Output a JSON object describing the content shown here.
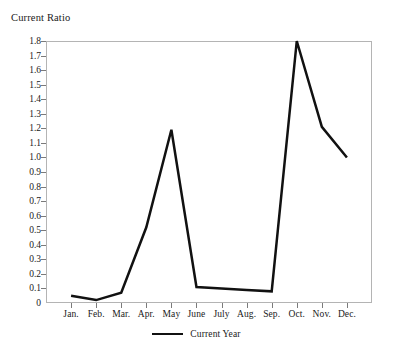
{
  "chart_data": {
    "type": "line",
    "title": "",
    "ylabel": "Current Ratio",
    "xlabel": "",
    "categories": [
      "Jan.",
      "Feb.",
      "Mar.",
      "Apr.",
      "May",
      "June",
      "July",
      "Aug.",
      "Sep.",
      "Oct.",
      "Nov.",
      "Dec."
    ],
    "series": [
      {
        "name": "Current Year",
        "color": "#111111",
        "values": [
          0.05,
          0.02,
          0.07,
          0.52,
          1.19,
          0.11,
          0.1,
          0.09,
          0.08,
          1.8,
          1.21,
          1.0
        ]
      }
    ],
    "ylim": [
      0,
      1.8
    ],
    "ytick_labels": [
      "1.8",
      "1.7",
      "1.6",
      "1.5",
      "1.4",
      "1.3",
      "1.2",
      "1.1",
      "1.0",
      "0.9",
      "0.8",
      "0.7",
      "0.6",
      "0.5",
      "0.4",
      "0.3",
      "0.2",
      "0.1",
      "0"
    ],
    "ytick_values": [
      1.8,
      1.7,
      1.6,
      1.5,
      1.4,
      1.3,
      1.2,
      1.1,
      1.0,
      0.9,
      0.8,
      0.7,
      0.6,
      0.5,
      0.4,
      0.3,
      0.2,
      0.1,
      0
    ],
    "grid": false,
    "legend_position": "bottom-center",
    "legend_entries": [
      "Current Year"
    ],
    "frame_color": "#b4b4b4",
    "tick_color": "#7a7a7a"
  },
  "legend": {
    "label": "Current Year"
  }
}
